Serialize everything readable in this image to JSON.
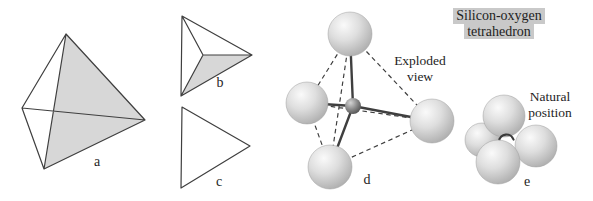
{
  "figure": {
    "title": {
      "line1": "Silicon-oxygen",
      "line2": "tetrahedron"
    },
    "exploded": {
      "line1": "Exploded",
      "line2": "view"
    },
    "natural": {
      "line1": "Natural",
      "line2": "position"
    },
    "labels": {
      "a": "a",
      "b": "b",
      "c": "c",
      "d": "d",
      "e": "e"
    }
  },
  "colors": {
    "background": "#ffffff",
    "line": "#3f3f3f",
    "shade_fill": "#d7d7d7",
    "sphere_highlight": "#fafafa",
    "sphere_mid": "#dedede",
    "sphere_edge": "#aaaaaa",
    "silicon_highlight": "#d4d4d4",
    "silicon_mid": "#8d8d8d",
    "silicon_edge": "#4a4a4a",
    "title_highlight": "#c9c9c9",
    "text": "#1e1e1e"
  }
}
